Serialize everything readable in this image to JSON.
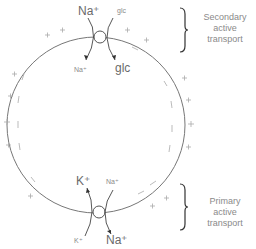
{
  "diagram": {
    "type": "cell membrane transport",
    "top_transporter": {
      "in_top_left": "Na⁺",
      "in_top_right": "glc",
      "out_bottom_left": "Na⁺",
      "out_bottom_right": "glc"
    },
    "bottom_transporter": {
      "top_left": "K⁺",
      "top_right": "Na⁺",
      "bottom_left": "K⁺",
      "bottom_right": "Na⁺"
    },
    "annotations": {
      "secondary": [
        "Secondary",
        "active",
        "transport"
      ],
      "primary": [
        "Primary",
        "active",
        "transport"
      ]
    },
    "colors": {
      "line": "#6e6e6e",
      "text": "#6a6a6a"
    }
  }
}
